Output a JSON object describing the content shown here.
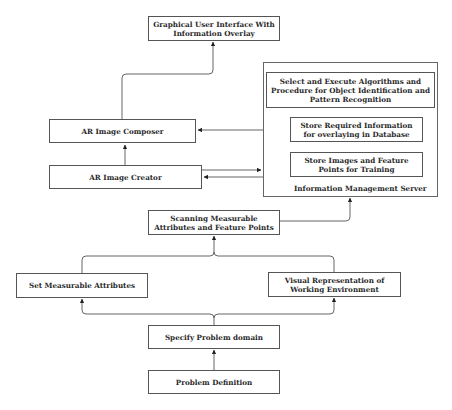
{
  "diagram": {
    "nodes": {
      "gui": "Graphical User Interface With Information Overlay",
      "ar_composer": "AR Image Composer",
      "ar_creator": "AR Image Creator",
      "server_title": "Information Management Server",
      "server_algorithms": "Select and Execute Algorithms and Procedure for Object Identification and Pattern Recognition",
      "server_store_info": "Store Required Information for overlaying in Database",
      "server_store_images": "Store Images and Feature Points for Training",
      "scanning": "Scanning Measurable Attributes and Feature Points",
      "set_attributes": "Set Measurable Attributes",
      "visual_rep": "Visual Representation of Working Environment",
      "specify_domain": "Specify Problem domain",
      "problem_def": "Problem Definition"
    },
    "edges": [
      {
        "from": "problem_def",
        "to": "specify_domain"
      },
      {
        "from": "specify_domain",
        "to": "set_attributes"
      },
      {
        "from": "specify_domain",
        "to": "visual_rep"
      },
      {
        "from": "set_attributes",
        "to": "scanning"
      },
      {
        "from": "visual_rep",
        "to": "scanning"
      },
      {
        "from": "scanning",
        "to": "server"
      },
      {
        "from": "ar_creator",
        "to": "server"
      },
      {
        "from": "server",
        "to": "ar_creator"
      },
      {
        "from": "server",
        "to": "ar_composer"
      },
      {
        "from": "ar_creator",
        "to": "ar_composer"
      },
      {
        "from": "ar_composer",
        "to": "gui"
      }
    ],
    "colors": {
      "stroke": "#555555",
      "background": "#ffffff",
      "text": "#2a2a2a"
    }
  }
}
